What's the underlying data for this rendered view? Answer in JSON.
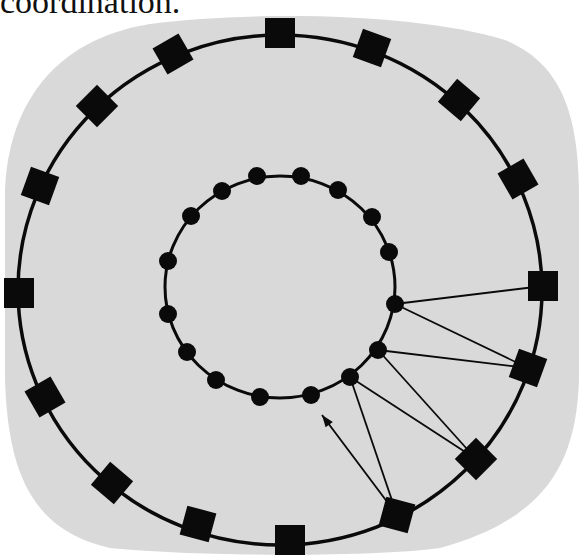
{
  "caption": {
    "text": "coordination."
  },
  "colors": {
    "background": "#d9d9d9",
    "ink": "#0a0a0a",
    "page": "#ffffff"
  },
  "diagram": {
    "outer_ring": {
      "cx": 280,
      "cy": 290,
      "rx": 262,
      "ry": 255,
      "node_shape": "square",
      "node_count": 16,
      "nodes": [
        {
          "x": 280,
          "y": 33,
          "rot": 0
        },
        {
          "x": 372,
          "y": 48,
          "rot": 20
        },
        {
          "x": 459,
          "y": 100,
          "rot": 40
        },
        {
          "x": 518,
          "y": 179,
          "rot": 60
        },
        {
          "x": 543,
          "y": 286,
          "rot": 0
        },
        {
          "x": 528,
          "y": 368,
          "rot": 20
        },
        {
          "x": 476,
          "y": 459,
          "rot": 45
        },
        {
          "x": 397,
          "y": 515,
          "rot": 15
        },
        {
          "x": 290,
          "y": 540,
          "rot": 0
        },
        {
          "x": 198,
          "y": 524,
          "rot": 15
        },
        {
          "x": 112,
          "y": 483,
          "rot": 40
        },
        {
          "x": 45,
          "y": 397,
          "rot": 60
        },
        {
          "x": 19,
          "y": 293,
          "rot": 0
        },
        {
          "x": 40,
          "y": 186,
          "rot": 20
        },
        {
          "x": 97,
          "y": 106,
          "rot": 45
        },
        {
          "x": 173,
          "y": 54,
          "rot": 60
        }
      ]
    },
    "inner_ring": {
      "cx": 280,
      "cy": 287,
      "rx": 115,
      "ry": 111,
      "node_shape": "circle",
      "node_count": 16,
      "nodes": [
        {
          "x": 257,
          "y": 176
        },
        {
          "x": 301,
          "y": 176
        },
        {
          "x": 338,
          "y": 190
        },
        {
          "x": 372,
          "y": 217
        },
        {
          "x": 389,
          "y": 252
        },
        {
          "x": 395,
          "y": 304
        },
        {
          "x": 378,
          "y": 350
        },
        {
          "x": 350,
          "y": 377
        },
        {
          "x": 311,
          "y": 395
        },
        {
          "x": 260,
          "y": 397
        },
        {
          "x": 216,
          "y": 380
        },
        {
          "x": 187,
          "y": 352
        },
        {
          "x": 168,
          "y": 314
        },
        {
          "x": 168,
          "y": 261
        },
        {
          "x": 191,
          "y": 216
        },
        {
          "x": 222,
          "y": 191
        }
      ]
    },
    "links": [
      {
        "from": [
          395,
          304
        ],
        "to": [
          543,
          286
        ]
      },
      {
        "from": [
          395,
          304
        ],
        "to": [
          528,
          368
        ]
      },
      {
        "from": [
          378,
          350
        ],
        "to": [
          528,
          368
        ]
      },
      {
        "from": [
          378,
          350
        ],
        "to": [
          476,
          459
        ]
      },
      {
        "from": [
          350,
          377
        ],
        "to": [
          476,
          459
        ]
      },
      {
        "from": [
          350,
          377
        ],
        "to": [
          397,
          515
        ]
      }
    ],
    "arrow": {
      "from": [
        397,
        515
      ],
      "to": [
        322,
        415
      ]
    }
  }
}
